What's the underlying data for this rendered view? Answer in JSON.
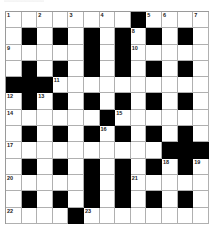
{
  "puzzle": {
    "rows": 13,
    "cols": 13,
    "colors": {
      "block": "#000000",
      "cell": "#ffffff",
      "line": "#b0b0b0"
    },
    "grid": [
      "........#....",
      ".#.#.#.#.#.#.",
      ".....#.#.....",
      ".#.#.#.#.#.#.",
      "###..........",
      ".#.#.#.#.#.#.",
      "......#......",
      ".#.#.#.#.#.#.",
      "..........###",
      ".#.#.#.#.#.#.",
      ".....#.#.....",
      ".#.#.#.#.#.#.",
      "....#........"
    ],
    "numbers": [
      {
        "row": 0,
        "col": 0,
        "n": "1"
      },
      {
        "row": 0,
        "col": 2,
        "n": "2"
      },
      {
        "row": 0,
        "col": 4,
        "n": "3"
      },
      {
        "row": 0,
        "col": 6,
        "n": "4"
      },
      {
        "row": 0,
        "col": 9,
        "n": "5"
      },
      {
        "row": 0,
        "col": 10,
        "n": "6"
      },
      {
        "row": 0,
        "col": 12,
        "n": "7"
      },
      {
        "row": 1,
        "col": 8,
        "n": "8"
      },
      {
        "row": 2,
        "col": 0,
        "n": "9"
      },
      {
        "row": 2,
        "col": 8,
        "n": "10"
      },
      {
        "row": 4,
        "col": 3,
        "n": "11"
      },
      {
        "row": 5,
        "col": 0,
        "n": "12"
      },
      {
        "row": 5,
        "col": 2,
        "n": "13"
      },
      {
        "row": 6,
        "col": 0,
        "n": "14"
      },
      {
        "row": 6,
        "col": 7,
        "n": "15"
      },
      {
        "row": 7,
        "col": 6,
        "n": "16"
      },
      {
        "row": 8,
        "col": 0,
        "n": "17"
      },
      {
        "row": 9,
        "col": 10,
        "n": "18"
      },
      {
        "row": 9,
        "col": 12,
        "n": "19"
      },
      {
        "row": 10,
        "col": 0,
        "n": "20"
      },
      {
        "row": 10,
        "col": 8,
        "n": "21"
      },
      {
        "row": 12,
        "col": 0,
        "n": "22"
      },
      {
        "row": 12,
        "col": 5,
        "n": "23"
      }
    ]
  }
}
